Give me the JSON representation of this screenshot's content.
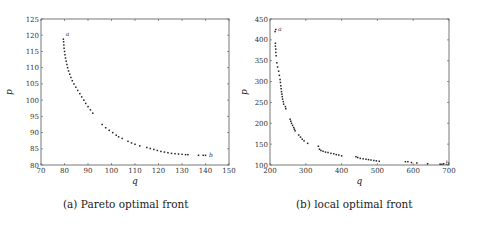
{
  "chart_data": [
    {
      "type": "scatter",
      "caption": "(a) Pareto optimal front",
      "title": "",
      "xlabel": "q",
      "ylabel": "p",
      "xlim": [
        70,
        150
      ],
      "ylim": [
        80,
        125
      ],
      "xticks": [
        70,
        80,
        90,
        100,
        110,
        120,
        130,
        140,
        150
      ],
      "yticks": [
        80,
        85,
        90,
        95,
        100,
        105,
        110,
        115,
        120,
        125
      ],
      "grid": false,
      "annotations": [
        {
          "text": "a",
          "x": 80.5,
          "y": 120.3
        },
        {
          "text": "b",
          "x": 141.5,
          "y": 83.0
        }
      ],
      "points": [
        [
          79.5,
          118.8
        ],
        [
          79.6,
          118.0
        ],
        [
          79.7,
          117.0
        ],
        [
          79.8,
          116.0
        ],
        [
          80.0,
          115.0
        ],
        [
          80.2,
          114.0
        ],
        [
          80.4,
          113.0
        ],
        [
          80.7,
          112.0
        ],
        [
          81.0,
          111.0
        ],
        [
          81.3,
          110.0
        ],
        [
          81.7,
          109.0
        ],
        [
          82.2,
          108.0
        ],
        [
          82.7,
          107.0
        ],
        [
          83.3,
          106.0
        ],
        [
          84.0,
          105.0
        ],
        [
          84.8,
          104.0
        ],
        [
          85.6,
          103.0
        ],
        [
          86.5,
          102.0
        ],
        [
          87.3,
          101.0
        ],
        [
          88.2,
          100.0
        ],
        [
          89.0,
          99.0
        ],
        [
          90.0,
          98.0
        ],
        [
          91.0,
          97.0
        ],
        [
          92.0,
          96.0
        ],
        [
          96.0,
          92.5
        ],
        [
          97.5,
          91.5
        ],
        [
          99.0,
          90.7
        ],
        [
          100.5,
          90.0
        ],
        [
          102.0,
          89.2
        ],
        [
          103.0,
          88.7
        ],
        [
          104.5,
          88.2
        ],
        [
          107.0,
          87.3
        ],
        [
          108.5,
          86.8
        ],
        [
          110.0,
          86.4
        ],
        [
          112.0,
          85.9
        ],
        [
          115.0,
          85.4
        ],
        [
          116.5,
          85.1
        ],
        [
          118.0,
          84.8
        ],
        [
          119.5,
          84.5
        ],
        [
          121.0,
          84.2
        ],
        [
          122.5,
          84.0
        ],
        [
          124.0,
          83.8
        ],
        [
          125.5,
          83.6
        ],
        [
          127.0,
          83.5
        ],
        [
          128.5,
          83.4
        ],
        [
          130.0,
          83.3
        ],
        [
          131.5,
          83.2
        ],
        [
          132.5,
          83.2
        ],
        [
          137.0,
          83.0
        ],
        [
          139.0,
          83.0
        ],
        [
          140.0,
          83.0
        ]
      ]
    },
    {
      "type": "scatter",
      "caption": "(b) local optimal front",
      "title": "",
      "xlabel": "q",
      "ylabel": "p",
      "xlim": [
        200,
        700
      ],
      "ylim": [
        100,
        450
      ],
      "xticks": [
        200,
        300,
        400,
        500,
        600,
        700
      ],
      "yticks": [
        100,
        150,
        200,
        250,
        300,
        350,
        400,
        450
      ],
      "grid": false,
      "annotations": [
        {
          "text": "a",
          "x": 222,
          "y": 425
        },
        {
          "text": "b",
          "x": 690,
          "y": 105
        }
      ],
      "points": [
        [
          214,
          420
        ],
        [
          216,
          425
        ],
        [
          215,
          392
        ],
        [
          215,
          385
        ],
        [
          216,
          378
        ],
        [
          216,
          370
        ],
        [
          217,
          362
        ],
        [
          219,
          345
        ],
        [
          221,
          335
        ],
        [
          224,
          325
        ],
        [
          226,
          315
        ],
        [
          228,
          305
        ],
        [
          229,
          298
        ],
        [
          230,
          290
        ],
        [
          231,
          283
        ],
        [
          232,
          276
        ],
        [
          233,
          270
        ],
        [
          234,
          264
        ],
        [
          235,
          258
        ],
        [
          237,
          252
        ],
        [
          238,
          246
        ],
        [
          243,
          240
        ],
        [
          244,
          235
        ],
        [
          256,
          210
        ],
        [
          258,
          205
        ],
        [
          260,
          200
        ],
        [
          263,
          195
        ],
        [
          266,
          190
        ],
        [
          268,
          186
        ],
        [
          270,
          182
        ],
        [
          280,
          172
        ],
        [
          285,
          167
        ],
        [
          290,
          162
        ],
        [
          295,
          158
        ],
        [
          305,
          152
        ],
        [
          335,
          145
        ],
        [
          338,
          138
        ],
        [
          342,
          135
        ],
        [
          348,
          133
        ],
        [
          355,
          131
        ],
        [
          362,
          130
        ],
        [
          370,
          128
        ],
        [
          378,
          127
        ],
        [
          385,
          125
        ],
        [
          392,
          124
        ],
        [
          400,
          122
        ],
        [
          440,
          120
        ],
        [
          445,
          118
        ],
        [
          452,
          116
        ],
        [
          460,
          115
        ],
        [
          468,
          114
        ],
        [
          475,
          113
        ],
        [
          482,
          112
        ],
        [
          490,
          111
        ],
        [
          497,
          110
        ],
        [
          505,
          109
        ],
        [
          578,
          108
        ],
        [
          585,
          108
        ],
        [
          595,
          106
        ],
        [
          610,
          105
        ],
        [
          640,
          103
        ],
        [
          675,
          102
        ],
        [
          680,
          102
        ],
        [
          685,
          103
        ]
      ]
    }
  ]
}
